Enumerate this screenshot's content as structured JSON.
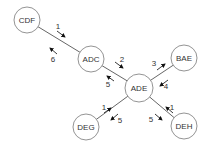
{
  "diagram": {
    "nodes": [
      {
        "id": "CDF",
        "label": "CDF",
        "x": 27,
        "y": 20,
        "r": 13
      },
      {
        "id": "ADC",
        "label": "ADC",
        "x": 91,
        "y": 59,
        "r": 13
      },
      {
        "id": "ADE",
        "label": "ADE",
        "x": 139,
        "y": 88,
        "r": 14
      },
      {
        "id": "BAE",
        "label": "BAE",
        "x": 184,
        "y": 58,
        "r": 13
      },
      {
        "id": "DEG",
        "label": "DEG",
        "x": 86,
        "y": 127,
        "r": 13
      },
      {
        "id": "DEH",
        "label": "DEH",
        "x": 184,
        "y": 126,
        "r": 13
      }
    ],
    "edges": [
      {
        "from": "CDF",
        "to": "ADC"
      },
      {
        "from": "ADC",
        "to": "ADE"
      },
      {
        "from": "ADE",
        "to": "BAE"
      },
      {
        "from": "DEG",
        "to": "ADE"
      },
      {
        "from": "DEH",
        "to": "ADE"
      }
    ],
    "arrows": [
      {
        "label": "1",
        "x1": 57,
        "y1": 31,
        "x2": 65,
        "y2": 37,
        "lx": 58,
        "ly": 26
      },
      {
        "label": "6",
        "x1": 57,
        "y1": 54,
        "x2": 50,
        "y2": 48,
        "lx": 53,
        "ly": 59
      },
      {
        "label": "2",
        "x1": 115,
        "y1": 62,
        "x2": 123,
        "y2": 68,
        "lx": 122,
        "ly": 59
      },
      {
        "label": "5",
        "x1": 114,
        "y1": 81,
        "x2": 107,
        "y2": 76,
        "lx": 108,
        "ly": 84
      },
      {
        "label": "3",
        "x1": 157,
        "y1": 70,
        "x2": 165,
        "y2": 64,
        "lx": 154,
        "ly": 63
      },
      {
        "label": "4",
        "x1": 168,
        "y1": 80,
        "x2": 160,
        "y2": 86,
        "lx": 166,
        "ly": 86
      },
      {
        "label": "1",
        "x1": 104,
        "y1": 113,
        "x2": 111,
        "y2": 108,
        "lx": 104,
        "ly": 107
      },
      {
        "label": "5",
        "x1": 118,
        "y1": 114,
        "x2": 111,
        "y2": 120,
        "lx": 120,
        "ly": 120
      },
      {
        "label": "1",
        "x1": 173,
        "y1": 113,
        "x2": 166,
        "y2": 107,
        "lx": 172,
        "ly": 107
      },
      {
        "label": "5",
        "x1": 155,
        "y1": 114,
        "x2": 162,
        "y2": 120,
        "lx": 151,
        "ly": 119
      }
    ]
  }
}
